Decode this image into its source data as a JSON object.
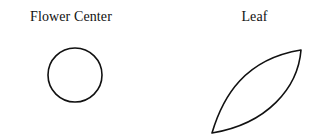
{
  "figure": {
    "background_color": "#ffffff",
    "stroke_color": "#111111",
    "panels": [
      {
        "id": "flower-center",
        "label": "Flower Center",
        "shape": "circle",
        "geometry": {
          "center_x": 75,
          "center_y": 75,
          "radius": 27
        }
      },
      {
        "id": "leaf",
        "label": "Leaf",
        "shape": "lens",
        "geometry": {
          "tip_start_x": 62,
          "tip_start_y": 133,
          "tip_end_x": 151,
          "tip_end_y": 50,
          "control_upper_x": 72,
          "control_upper_y": 58,
          "control_lower_x": 141,
          "control_lower_y": 125
        }
      }
    ]
  }
}
